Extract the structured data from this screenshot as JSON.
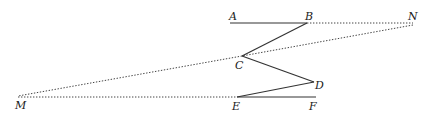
{
  "diagram": {
    "points": {
      "A": {
        "label": "A",
        "x": 230,
        "y": 23
      },
      "B": {
        "label": "B",
        "x": 307,
        "y": 23
      },
      "N": {
        "label": "N",
        "x": 413,
        "y": 23
      },
      "C": {
        "label": "C",
        "x": 242,
        "y": 56
      },
      "D": {
        "label": "D",
        "x": 314,
        "y": 82
      },
      "E": {
        "label": "E",
        "x": 237,
        "y": 97
      },
      "F": {
        "label": "F",
        "x": 316,
        "y": 97
      },
      "M": {
        "label": "M",
        "x": 18,
        "y": 97
      }
    },
    "solid_segments": [
      "AB",
      "BC",
      "CD",
      "DE",
      "EF"
    ],
    "dotted_segments": [
      "BN",
      "NC",
      "CM",
      "ME"
    ],
    "colors": {
      "line": "#333333",
      "text": "#1a1a1a",
      "background": "#ffffff"
    }
  }
}
